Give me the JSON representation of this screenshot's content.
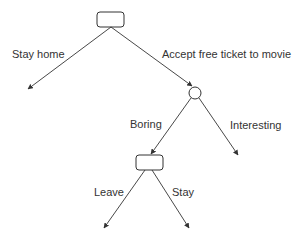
{
  "diagram": {
    "type": "decision-tree",
    "nodes": [
      {
        "id": "decision-1",
        "shape": "rounded-rectangle"
      },
      {
        "id": "chance-1",
        "shape": "circle"
      },
      {
        "id": "decision-2",
        "shape": "rounded-rectangle"
      }
    ],
    "edges": [
      {
        "from": "decision-1",
        "to": "end",
        "label": "Stay home"
      },
      {
        "from": "decision-1",
        "to": "chance-1",
        "label": "Accept free ticket to movie"
      },
      {
        "from": "chance-1",
        "to": "decision-2",
        "label": "Boring"
      },
      {
        "from": "chance-1",
        "to": "end",
        "label": "Interesting"
      },
      {
        "from": "decision-2",
        "to": "end",
        "label": "Leave"
      },
      {
        "from": "decision-2",
        "to": "end",
        "label": "Stay"
      }
    ],
    "colors": {
      "line": "#333333",
      "background": "#ffffff"
    }
  }
}
